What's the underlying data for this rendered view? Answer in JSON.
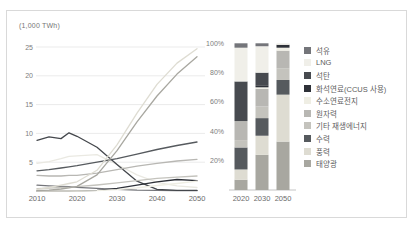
{
  "panel": {
    "type": "figure"
  },
  "chart_data": [
    {
      "type": "line",
      "unit_label": "(1,000 TWh)",
      "x": [
        2010,
        2013,
        2016,
        2018,
        2020,
        2025,
        2030,
        2035,
        2040,
        2045,
        2050
      ],
      "x_ticks": [
        "2010",
        "2020",
        "2030",
        "2040",
        "2050"
      ],
      "y_ticks": [
        5,
        10,
        15,
        20,
        25
      ],
      "ylim": [
        0,
        26
      ],
      "grid": true,
      "series": [
        {
          "name": "석유",
          "color": "#74757a",
          "values": [
            1.0,
            0.9,
            0.8,
            0.75,
            0.65,
            0.45,
            0.3,
            0.15,
            0.1,
            0.05,
            0.05
          ]
        },
        {
          "name": "LNG",
          "color": "#eae9e2",
          "values": [
            4.8,
            5.1,
            5.6,
            6.0,
            6.1,
            6.3,
            4.6,
            2.8,
            1.5,
            0.9,
            0.6
          ]
        },
        {
          "name": "석탄",
          "color": "#44474c",
          "values": [
            8.8,
            9.4,
            9.1,
            10.1,
            9.5,
            7.6,
            4.6,
            1.7,
            0.3,
            0.1,
            0.1
          ]
        },
        {
          "name": "화석연료(CCUS 사용)",
          "color": "#2e3138",
          "values": [
            0,
            0,
            0,
            0,
            0.02,
            0.1,
            0.45,
            1.0,
            1.6,
            2.0,
            1.8
          ]
        },
        {
          "name": "수소연료전지",
          "color": "#efeee4",
          "values": [
            0,
            0,
            0,
            0,
            0,
            0.05,
            0.25,
            0.55,
            0.95,
            1.3,
            1.7
          ]
        },
        {
          "name": "원자력",
          "color": "#b8b7b3",
          "values": [
            2.7,
            2.6,
            2.6,
            2.7,
            2.7,
            3.1,
            3.7,
            4.3,
            4.8,
            5.2,
            5.5
          ]
        },
        {
          "name": "기타 재생에너지",
          "color": "#c4c3bd",
          "values": [
            0.4,
            0.5,
            0.6,
            0.65,
            0.75,
            1.05,
            1.4,
            1.8,
            2.2,
            2.4,
            2.6
          ]
        },
        {
          "name": "수력",
          "color": "#565a5e",
          "values": [
            3.5,
            3.7,
            4.0,
            4.2,
            4.4,
            5.0,
            5.6,
            6.4,
            7.2,
            7.9,
            8.5
          ]
        },
        {
          "name": "풍력",
          "color": "#dedcd2",
          "values": [
            0.3,
            0.6,
            1.0,
            1.3,
            1.6,
            3.6,
            8.0,
            13.5,
            18.5,
            22.2,
            24.7
          ]
        },
        {
          "name": "태양광",
          "color": "#a8a7a0",
          "values": [
            0.05,
            0.15,
            0.35,
            0.55,
            0.8,
            2.8,
            7.0,
            12.0,
            16.5,
            20.3,
            23.3
          ]
        }
      ]
    },
    {
      "type": "stacked_bar_percent",
      "categories": [
        "2020",
        "2030",
        "2050"
      ],
      "y_ticks": [
        "100%",
        "80%",
        "60%",
        "40%",
        "20%"
      ],
      "ylim": [
        0,
        100
      ],
      "legend_position": "right",
      "series": [
        {
          "name": "석유",
          "color": "#74757a",
          "values": [
            3,
            2,
            0
          ]
        },
        {
          "name": "LNG",
          "color": "#f0efe9",
          "values": [
            23,
            18,
            1
          ]
        },
        {
          "name": "석탄",
          "color": "#474a4f",
          "values": [
            27,
            9,
            0
          ]
        },
        {
          "name": "화석연료(CCUS 사용)",
          "color": "#2e3138",
          "values": [
            0,
            1,
            2
          ]
        },
        {
          "name": "수소연료전지",
          "color": "#efeee4",
          "values": [
            0,
            1,
            2
          ]
        },
        {
          "name": "원자력",
          "color": "#b8b7b3",
          "values": [
            13,
            12,
            12
          ]
        },
        {
          "name": "기타 재생에너지",
          "color": "#c4c3bd",
          "values": [
            5,
            8,
            8
          ]
        },
        {
          "name": "수력",
          "color": "#565a5e",
          "values": [
            15,
            12,
            10
          ]
        },
        {
          "name": "풍력",
          "color": "#dedcd2",
          "values": [
            7,
            13,
            32
          ]
        },
        {
          "name": "태양광",
          "color": "#a8a7a0",
          "values": [
            7,
            24,
            33
          ]
        }
      ]
    }
  ]
}
